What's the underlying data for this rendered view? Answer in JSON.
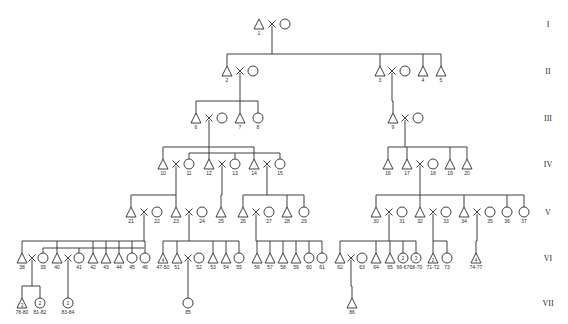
{
  "diagram": {
    "type": "pedigree",
    "generations": [
      {
        "label": "I",
        "y": 24
      },
      {
        "label": "II",
        "y": 71
      },
      {
        "label": "III",
        "y": 118
      },
      {
        "label": "IV",
        "y": 164
      },
      {
        "label": "V",
        "y": 212
      },
      {
        "label": "VI",
        "y": 258
      },
      {
        "label": "VII",
        "y": 303
      }
    ],
    "individuals": [
      {
        "id": "1",
        "sex": "M",
        "x": 259,
        "gen": 0
      },
      {
        "id": "",
        "sex": "F",
        "x": 285,
        "gen": 0
      },
      {
        "id": "2",
        "sex": "M",
        "x": 227,
        "gen": 1
      },
      {
        "id": "",
        "sex": "F",
        "x": 253,
        "gen": 1
      },
      {
        "id": "3",
        "sex": "M",
        "x": 380,
        "gen": 1
      },
      {
        "id": "",
        "sex": "F",
        "x": 405,
        "gen": 1
      },
      {
        "id": "4",
        "sex": "M",
        "x": 423,
        "gen": 1
      },
      {
        "id": "5",
        "sex": "M",
        "x": 441,
        "gen": 1
      },
      {
        "id": "6",
        "sex": "M",
        "x": 196,
        "gen": 2
      },
      {
        "id": "",
        "sex": "F",
        "x": 222,
        "gen": 2
      },
      {
        "id": "7",
        "sex": "M",
        "x": 240,
        "gen": 2
      },
      {
        "id": "8",
        "sex": "F",
        "x": 258,
        "gen": 2
      },
      {
        "id": "9",
        "sex": "M",
        "x": 393,
        "gen": 2
      },
      {
        "id": "",
        "sex": "F",
        "x": 418,
        "gen": 2
      },
      {
        "id": "10",
        "sex": "M",
        "x": 163,
        "gen": 3
      },
      {
        "id": "11",
        "sex": "F",
        "x": 189,
        "gen": 3
      },
      {
        "id": "12",
        "sex": "M",
        "x": 209,
        "gen": 3
      },
      {
        "id": "13",
        "sex": "F",
        "x": 235,
        "gen": 3
      },
      {
        "id": "14",
        "sex": "M",
        "x": 254,
        "gen": 3
      },
      {
        "id": "15",
        "sex": "F",
        "x": 280,
        "gen": 3
      },
      {
        "id": "16",
        "sex": "M",
        "x": 388,
        "gen": 3
      },
      {
        "id": "17",
        "sex": "M",
        "x": 407,
        "gen": 3
      },
      {
        "id": "18",
        "sex": "F",
        "x": 433,
        "gen": 3
      },
      {
        "id": "19",
        "sex": "M",
        "x": 450,
        "gen": 3
      },
      {
        "id": "20",
        "sex": "M",
        "x": 467,
        "gen": 3
      },
      {
        "id": "21",
        "sex": "M",
        "x": 131,
        "gen": 4
      },
      {
        "id": "22",
        "sex": "F",
        "x": 157,
        "gen": 4
      },
      {
        "id": "23",
        "sex": "M",
        "x": 176,
        "gen": 4
      },
      {
        "id": "24",
        "sex": "F",
        "x": 202,
        "gen": 4
      },
      {
        "id": "25",
        "sex": "M",
        "x": 221,
        "gen": 4
      },
      {
        "id": "26",
        "sex": "M",
        "x": 243,
        "gen": 4
      },
      {
        "id": "27",
        "sex": "F",
        "x": 269,
        "gen": 4
      },
      {
        "id": "28",
        "sex": "M",
        "x": 287,
        "gen": 4
      },
      {
        "id": "29",
        "sex": "F",
        "x": 304,
        "gen": 4
      },
      {
        "id": "30",
        "sex": "M",
        "x": 376,
        "gen": 4
      },
      {
        "id": "31",
        "sex": "F",
        "x": 402,
        "gen": 4
      },
      {
        "id": "32",
        "sex": "M",
        "x": 420,
        "gen": 4
      },
      {
        "id": "33",
        "sex": "F",
        "x": 446,
        "gen": 4
      },
      {
        "id": "34",
        "sex": "M",
        "x": 464,
        "gen": 4
      },
      {
        "id": "35",
        "sex": "F",
        "x": 490,
        "gen": 4
      },
      {
        "id": "36",
        "sex": "F",
        "x": 507,
        "gen": 4
      },
      {
        "id": "37",
        "sex": "F",
        "x": 524,
        "gen": 4
      },
      {
        "id": "38",
        "sex": "M",
        "x": 22,
        "gen": 5
      },
      {
        "id": "39",
        "sex": "F",
        "x": 43,
        "gen": 5
      },
      {
        "id": "40",
        "sex": "M",
        "x": 57,
        "gen": 5
      },
      {
        "id": "41",
        "sex": "F",
        "x": 79,
        "gen": 5
      },
      {
        "id": "42",
        "sex": "M",
        "x": 93,
        "gen": 5
      },
      {
        "id": "43",
        "sex": "M",
        "x": 106,
        "gen": 5
      },
      {
        "id": "44",
        "sex": "M",
        "x": 119,
        "gen": 5
      },
      {
        "id": "45",
        "sex": "F",
        "x": 132,
        "gen": 5
      },
      {
        "id": "46",
        "sex": "F",
        "x": 145,
        "gen": 5
      },
      {
        "id": "47-50",
        "sex": "M",
        "x": 163,
        "gen": 5,
        "count": "4"
      },
      {
        "id": "51",
        "sex": "M",
        "x": 177,
        "gen": 5
      },
      {
        "id": "52",
        "sex": "F",
        "x": 199,
        "gen": 5
      },
      {
        "id": "53",
        "sex": "M",
        "x": 213,
        "gen": 5
      },
      {
        "id": "54",
        "sex": "M",
        "x": 226,
        "gen": 5
      },
      {
        "id": "55",
        "sex": "F",
        "x": 239,
        "gen": 5
      },
      {
        "id": "56",
        "sex": "M",
        "x": 257,
        "gen": 5
      },
      {
        "id": "57",
        "sex": "M",
        "x": 270,
        "gen": 5
      },
      {
        "id": "58",
        "sex": "M",
        "x": 283,
        "gen": 5
      },
      {
        "id": "59",
        "sex": "M",
        "x": 296,
        "gen": 5
      },
      {
        "id": "60",
        "sex": "F",
        "x": 309,
        "gen": 5
      },
      {
        "id": "61",
        "sex": "F",
        "x": 322,
        "gen": 5
      },
      {
        "id": "62",
        "sex": "M",
        "x": 340,
        "gen": 5
      },
      {
        "id": "63",
        "sex": "F",
        "x": 362,
        "gen": 5
      },
      {
        "id": "64",
        "sex": "M",
        "x": 376,
        "gen": 5
      },
      {
        "id": "65",
        "sex": "M",
        "x": 390,
        "gen": 5
      },
      {
        "id": "66-67",
        "sex": "F",
        "x": 403,
        "gen": 5,
        "count": "2"
      },
      {
        "id": "68-70",
        "sex": "F",
        "x": 416,
        "gen": 5,
        "count": "3"
      },
      {
        "id": "71-72",
        "sex": "M",
        "x": 433,
        "gen": 5,
        "count": "2"
      },
      {
        "id": "73",
        "sex": "F",
        "x": 447,
        "gen": 5
      },
      {
        "id": "74-77",
        "sex": "M",
        "x": 476,
        "gen": 5,
        "count": "4"
      },
      {
        "id": "78-80",
        "sex": "M",
        "x": 22,
        "gen": 6,
        "count": "3"
      },
      {
        "id": "81-82",
        "sex": "F",
        "x": 40,
        "gen": 6,
        "count": "2"
      },
      {
        "id": "83-84",
        "sex": "F",
        "x": 68,
        "gen": 6,
        "count": "2"
      },
      {
        "id": "85",
        "sex": "F",
        "x": 188,
        "gen": 6
      },
      {
        "id": "86",
        "sex": "M",
        "x": 352,
        "gen": 6
      }
    ],
    "marriages": [
      {
        "x": 272,
        "gen": 0
      },
      {
        "x": 240,
        "gen": 1
      },
      {
        "x": 392,
        "gen": 1
      },
      {
        "x": 209,
        "gen": 2
      },
      {
        "x": 405,
        "gen": 2
      },
      {
        "x": 176,
        "gen": 3
      },
      {
        "x": 222,
        "gen": 3
      },
      {
        "x": 267,
        "gen": 3
      },
      {
        "x": 420,
        "gen": 3
      },
      {
        "x": 144,
        "gen": 4
      },
      {
        "x": 189,
        "gen": 4
      },
      {
        "x": 256,
        "gen": 4
      },
      {
        "x": 389,
        "gen": 4
      },
      {
        "x": 433,
        "gen": 4
      },
      {
        "x": 477,
        "gen": 4
      },
      {
        "x": 32,
        "gen": 5
      },
      {
        "x": 68,
        "gen": 5
      },
      {
        "x": 188,
        "gen": 5
      },
      {
        "x": 351,
        "gen": 5
      }
    ],
    "sibships": [
      {
        "from_x": 272,
        "gen": 0,
        "children_x": [
          227,
          380,
          423,
          441
        ]
      },
      {
        "from_x": 240,
        "gen": 1,
        "children_x": [
          196,
          240,
          258
        ]
      },
      {
        "from_x": 392,
        "gen": 1,
        "children_x": [
          393
        ]
      },
      {
        "from_x": 209,
        "gen": 2,
        "children_x": [
          163,
          209,
          254
        ],
        "second_bar": {
          "children_x": [
            189,
            235,
            280
          ],
          "offset": 6
        }
      },
      {
        "from_x": 405,
        "gen": 2,
        "children_x": [
          388,
          407,
          450,
          467
        ]
      },
      {
        "from_x": 176,
        "gen": 3,
        "children_x": [
          131,
          176
        ]
      },
      {
        "from_x": 222,
        "gen": 3,
        "children_x": [
          221
        ]
      },
      {
        "from_x": 267,
        "gen": 3,
        "children_x": [
          243,
          287,
          304
        ]
      },
      {
        "from_x": 420,
        "gen": 3,
        "children_x": [
          376,
          420,
          464,
          507,
          524
        ]
      },
      {
        "from_x": 144,
        "gen": 4,
        "children_x": [
          22,
          57,
          93,
          106,
          119,
          132,
          145
        ],
        "second_bar": {
          "children_x": [
            43,
            79
          ],
          "offset": 7
        }
      },
      {
        "from_x": 189,
        "gen": 4,
        "children_x": [
          163,
          177,
          213,
          226,
          239
        ]
      },
      {
        "from_x": 256,
        "gen": 4,
        "children_x": [
          257,
          270,
          283,
          296,
          309,
          322
        ]
      },
      {
        "from_x": 389,
        "gen": 4,
        "children_x": [
          340,
          376,
          390,
          403,
          416
        ]
      },
      {
        "from_x": 433,
        "gen": 4,
        "children_x": [
          433,
          447
        ]
      },
      {
        "from_x": 477,
        "gen": 4,
        "children_x": [
          476
        ]
      },
      {
        "from_x": 32,
        "gen": 5,
        "children_x": [
          22,
          40
        ]
      },
      {
        "from_x": 68,
        "gen": 5,
        "children_x": [
          68
        ]
      },
      {
        "from_x": 188,
        "gen": 5,
        "children_x": [
          188
        ]
      },
      {
        "from_x": 351,
        "gen": 5,
        "children_x": [
          352
        ]
      }
    ],
    "generation_label_x": 548,
    "line_color": "#2a2a2a"
  }
}
